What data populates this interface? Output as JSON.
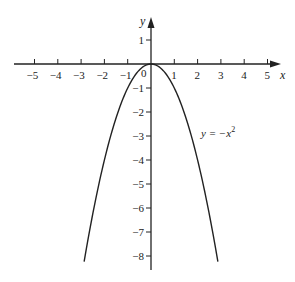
{
  "chart_data": {
    "type": "line",
    "title": "",
    "xlabel": "x",
    "ylabel": "y",
    "xlim": [
      -5.5,
      5.5
    ],
    "ylim": [
      -8.5,
      1.9
    ],
    "grid": false,
    "x_ticks": [
      -5,
      -4,
      -3,
      -2,
      -1,
      1,
      2,
      3,
      4,
      5
    ],
    "x_tick_labels": [
      "−5",
      "−4",
      "−3",
      "−2",
      "−1",
      "1",
      "2",
      "3",
      "4",
      "5"
    ],
    "y_ticks": [
      1,
      -1,
      -2,
      -3,
      -4,
      -5,
      -6,
      -7,
      -8
    ],
    "y_tick_labels": [
      "1",
      "−1",
      "−2",
      "−3",
      "−4",
      "−5",
      "−6",
      "−7",
      "−8"
    ],
    "origin_label": "0",
    "series": [
      {
        "name": "y = −x²",
        "equation": "y = -x^2",
        "x_range": [
          -2.87,
          2.87
        ],
        "x": [
          -2.87,
          -2.5,
          -2,
          -1.5,
          -1,
          -0.5,
          0,
          0.5,
          1,
          1.5,
          2,
          2.5,
          2.87
        ],
        "y": [
          -8.24,
          -6.25,
          -4,
          -2.25,
          -1,
          -0.25,
          0,
          -0.25,
          -1,
          -2.25,
          -4,
          -6.25,
          -8.24
        ],
        "color": "#222222"
      }
    ],
    "annotations": [
      {
        "text_main": "y = −x",
        "superscript": "2",
        "x": 2.1,
        "y": -3.1
      }
    ]
  }
}
